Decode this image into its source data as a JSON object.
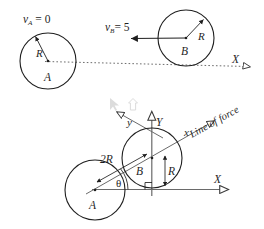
{
  "figure": {
    "background_color": "#ffffff",
    "stroke_color": "#1f1f1f",
    "axis_color": "#4a4a4a"
  },
  "top_panel": {
    "name": "before-impact-view",
    "disk_a": {
      "label": "A",
      "radius_label": "R",
      "velocity_label": {
        "symbol": "v",
        "subscript": "A",
        "equals": "=",
        "value": "0"
      },
      "center_px": [
        48,
        61
      ],
      "radius_px": 28
    },
    "disk_b": {
      "label": "B",
      "radius_label": "R",
      "velocity_label": {
        "symbol": "v",
        "subscript": "B",
        "equals": "=",
        "value": "5"
      },
      "center_px": [
        186,
        38
      ],
      "radius_px": 28,
      "velocity_direction": "left"
    },
    "axis_x_label": "X",
    "centerline_style": "dotted"
  },
  "bottom_panel": {
    "name": "line-of-force-view",
    "disk_a": {
      "label": "A",
      "center_px": [
        95,
        190
      ],
      "radius_px": 30
    },
    "disk_b": {
      "label": "B",
      "radius_label": "R",
      "center_px": [
        152,
        158
      ],
      "radius_px": 30
    },
    "separation_label": "2R",
    "angle_label": "θ",
    "axes": {
      "global_x": "X",
      "global_y": "Y",
      "local_x": "x",
      "local_y": "y"
    },
    "annotation": "Line of force",
    "right_angle_marker": true
  }
}
